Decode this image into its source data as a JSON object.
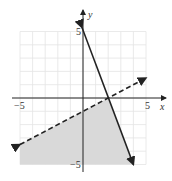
{
  "chart_data": {
    "type": "line",
    "title": "",
    "xlabel": "x",
    "ylabel": "y",
    "xlim": [
      -5,
      5
    ],
    "ylim": [
      -5,
      5
    ],
    "grid": true,
    "tick_labels": {
      "x": [
        "-5",
        "5"
      ],
      "y": [
        "5",
        "-5"
      ]
    },
    "series": [
      {
        "name": "solid boundary",
        "style": "solid",
        "equation": "y = -2.5x + 5",
        "points": [
          [
            0,
            5
          ],
          [
            4,
            -5
          ]
        ]
      },
      {
        "name": "dashed boundary",
        "style": "dashed",
        "equation": "y = 0.5x - 1",
        "points": [
          [
            -5,
            -3.5
          ],
          [
            5,
            1.5
          ]
        ]
      }
    ],
    "shaded_region": {
      "description": "region below dashed line and left of solid line",
      "color": "#d9d9d9",
      "vertices": [
        [
          -5,
          -3.5
        ],
        [
          2,
          0
        ],
        [
          4,
          -5
        ],
        [
          -5,
          -5
        ]
      ]
    },
    "labels": {
      "x_axis": "x",
      "y_axis": "y",
      "x_neg": "−5",
      "x_pos": "5",
      "y_pos": "5",
      "y_neg": "−5"
    }
  }
}
